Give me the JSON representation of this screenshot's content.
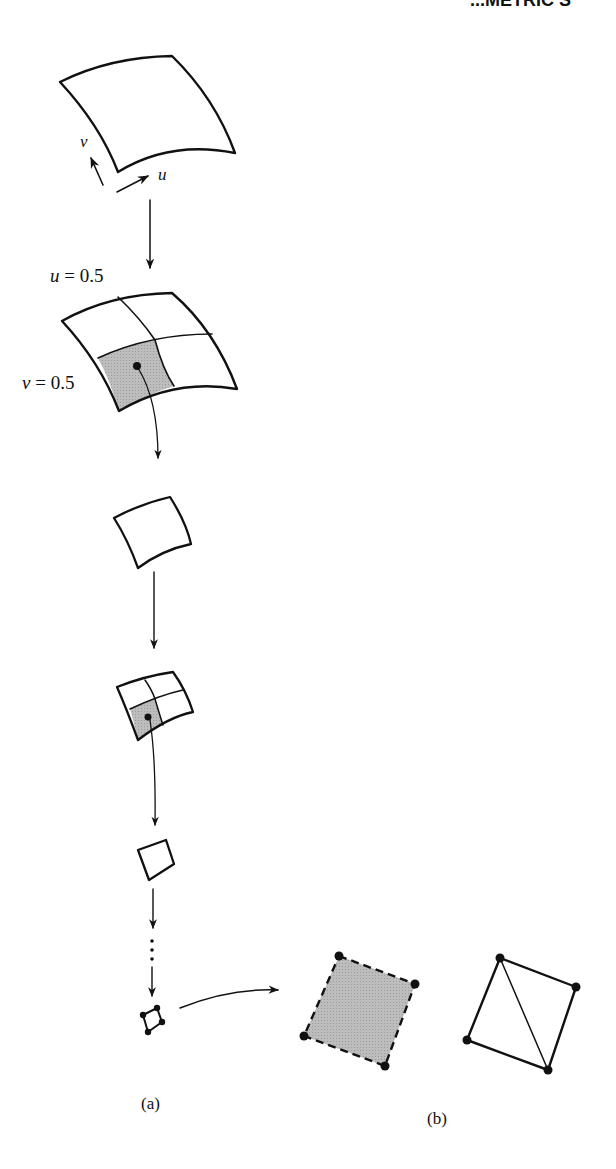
{
  "header_fragment": "...METRIC S",
  "labels": {
    "param_u": "u",
    "param_v": "v",
    "split_u": "u = 0.5",
    "split_v": "v = 0.5",
    "ellipsis": "⋮",
    "caption_a": "(a)",
    "caption_b": "(b)"
  },
  "colors": {
    "line": "#111111",
    "shade": "#b8b8b8",
    "background": "#ffffff"
  },
  "diagram": {
    "panels": [
      {
        "id": "a",
        "steps": [
          "patch",
          "subdivided patch (shaded sub-patch)",
          "sub-patch",
          "subdivided sub-patch",
          "smaller patch",
          "…",
          "tiny quad with corner points"
        ]
      },
      {
        "id": "b",
        "items": [
          "flat shaded quad with dashed edges and corner points",
          "quad split into two triangles"
        ]
      }
    ]
  }
}
